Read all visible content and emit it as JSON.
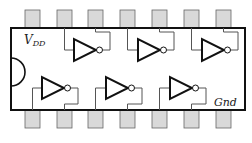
{
  "diagram": {
    "labels": {
      "vdd": "V",
      "vdd_sub": "DD",
      "gnd": "Gnd"
    },
    "colors": {
      "outline": "#111111",
      "pin_fill": "#d9d9d9",
      "pin_stroke": "#555555",
      "wire": "#555555",
      "gate": "#111111"
    },
    "pins_top_count": 7,
    "pins_bottom_count": 7,
    "gates": [
      {
        "row": "top",
        "index": 1,
        "type": "inverter"
      },
      {
        "row": "top",
        "index": 2,
        "type": "inverter"
      },
      {
        "row": "top",
        "index": 3,
        "type": "inverter"
      },
      {
        "row": "bottom",
        "index": 1,
        "type": "inverter"
      },
      {
        "row": "bottom",
        "index": 2,
        "type": "inverter"
      },
      {
        "row": "bottom",
        "index": 3,
        "type": "inverter"
      }
    ]
  }
}
